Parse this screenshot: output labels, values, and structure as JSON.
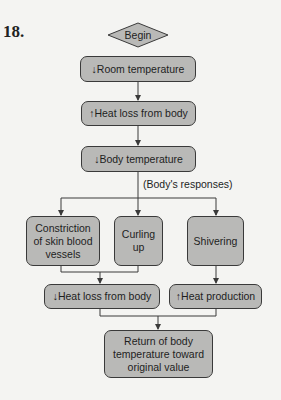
{
  "figure": {
    "number": "18.",
    "start": "Begin",
    "nodes": {
      "room": "↓Room temperature",
      "heat_loss_up": "↑Heat loss from body",
      "body_temp": "↓Body temperature",
      "responses_label": "(Body's responses)",
      "constriction": "Constriction of skin blood vessels",
      "curling": "Curling up",
      "shivering": "Shivering",
      "heat_loss_down": "↓Heat loss from body",
      "heat_production": "↑Heat production",
      "return": "Return of body temperature toward original value"
    }
  },
  "colors": {
    "box_fill": "#b9b9b7",
    "stroke": "#3a3a3a",
    "background": "#f4f4f2"
  }
}
